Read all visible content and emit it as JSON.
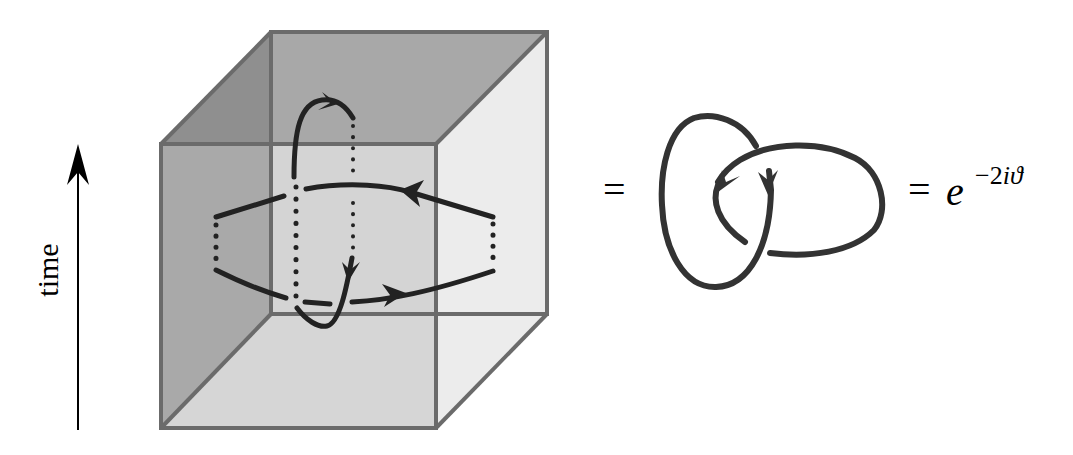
{
  "figure": {
    "axis_label": "time",
    "equals_1": "=",
    "equals_2": "=",
    "result": {
      "base": "e",
      "exponent_sign": "−",
      "exponent_coeff": "2",
      "exponent_i": "i",
      "exponent_theta": "ϑ"
    }
  },
  "colors": {
    "background": "#ffffff",
    "cube_edge": "#6b6b6b",
    "left_face": "#8f8f8f",
    "left_face_lower": "#a9a9a9",
    "back_face": "#aaaaaa",
    "back_face_inner": "#d4d4d4",
    "right_face": "#ececec",
    "bottom_face": "#d9d9d9",
    "curve": "#222222",
    "arrow": "#000000"
  },
  "elements": {
    "cube": "spacetime-cube",
    "worldline_vertical": "vertical-worldline-loop",
    "worldline_horizontal": "horizontal-worldline-loop",
    "knot": "hopf-link"
  }
}
